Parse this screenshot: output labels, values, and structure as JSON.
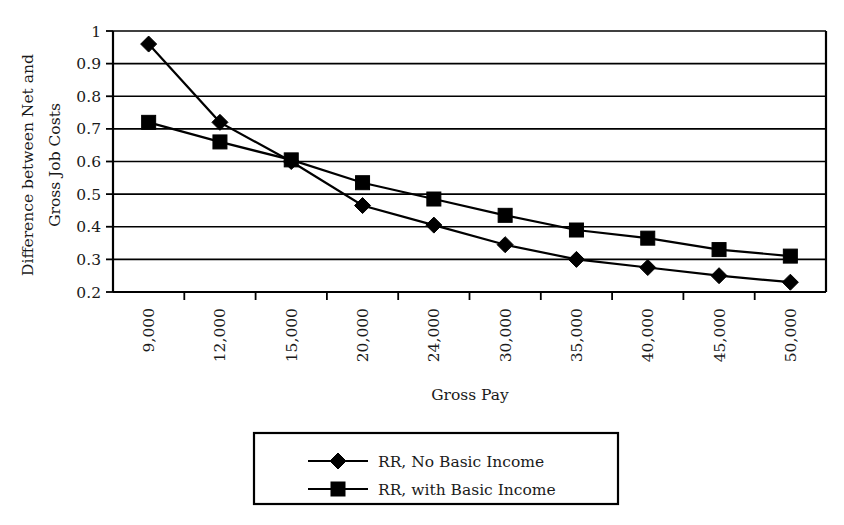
{
  "chart_data": {
    "type": "line",
    "title": "",
    "xlabel": "Gross Pay",
    "ylabel": "Difference between Net and Gross Job Costs",
    "ylabel_lines": [
      "Difference between Net and",
      "Gross Job Costs"
    ],
    "categories": [
      "9,000",
      "12,000",
      "15,000",
      "20,000",
      "24,000",
      "30,000",
      "35,000",
      "40,000",
      "45,000",
      "50,000"
    ],
    "ylim": [
      0.2,
      1
    ],
    "yticks": [
      "0.2",
      "0.3",
      "0.4",
      "0.5",
      "0.6",
      "0.7",
      "0.8",
      "0.9",
      "1"
    ],
    "ytick_values": [
      0.2,
      0.3,
      0.4,
      0.5,
      0.6,
      0.7,
      0.8,
      0.9,
      1
    ],
    "grid": true,
    "legend_position": "bottom",
    "series": [
      {
        "name": "RR, No Basic Income",
        "marker": "diamond",
        "color": "#000000",
        "values": [
          0.96,
          0.72,
          0.6,
          0.465,
          0.405,
          0.345,
          0.3,
          0.275,
          0.25,
          0.23
        ]
      },
      {
        "name": "RR, with Basic Income",
        "marker": "square",
        "color": "#000000",
        "values": [
          0.72,
          0.66,
          0.605,
          0.535,
          0.485,
          0.435,
          0.39,
          0.365,
          0.33,
          0.31
        ]
      }
    ]
  },
  "legend": {
    "entries": [
      {
        "label": "RR, No Basic Income",
        "marker": "diamond"
      },
      {
        "label": "RR, with Basic Income",
        "marker": "square"
      }
    ]
  }
}
